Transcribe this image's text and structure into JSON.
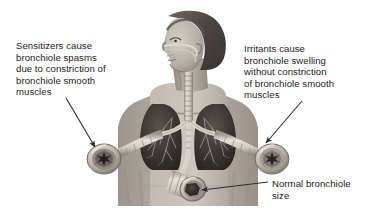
{
  "figure": {
    "background_color": "#ffffff",
    "width": 376,
    "height": 222
  },
  "captions": {
    "left": {
      "text": "Sensitizers cause\nbronchiole spasms\ndue to constriction of\nbronchiole smooth\nmuscles",
      "points_to": "constricted-bronchiole"
    },
    "right": {
      "text": "Irritants cause\nbronchiole swelling\nwithout constriction\nof bronchiole smooth\nmuscles",
      "points_to": "swollen-bronchiole"
    },
    "bottom": {
      "text": "Normal bronchiole\nsize",
      "points_to": "normal-bronchiole"
    }
  },
  "anatomy": {
    "subject": "woman-head-and-torso-profile",
    "structures": [
      {
        "name": "nasal-passage",
        "label": "nasal passage"
      },
      {
        "name": "trachea",
        "label": "trachea"
      },
      {
        "name": "left-lung",
        "label": "left lung"
      },
      {
        "name": "right-lung",
        "label": "right lung"
      },
      {
        "name": "bronchial-tree",
        "label": "bronchial tree"
      }
    ],
    "bronchioles": [
      {
        "name": "constricted-bronchiole",
        "state": "constricted",
        "lumen": "narrow star-shaped"
      },
      {
        "name": "swollen-bronchiole",
        "state": "swollen",
        "lumen": "narrow, thickened wall"
      },
      {
        "name": "normal-bronchiole",
        "state": "normal",
        "lumen": "wide open"
      }
    ]
  },
  "colors": {
    "text": "#1b1b1b",
    "leader_line": "#2b2b2b",
    "skin": "#b9b3ad",
    "skin_shadow": "#8e8880",
    "hair": "#514c48",
    "lung_field": "#3a3531",
    "airway": "#d8d3cc",
    "airway_shadow": "#928c85"
  }
}
